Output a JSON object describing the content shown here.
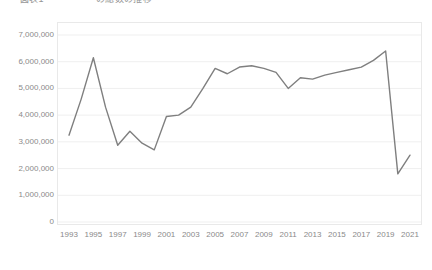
{
  "chart_title": "図表1 　　　　 　の総数の推移",
  "colors": {
    "line": "#7f7f7f",
    "gridline": "#efefef",
    "border": "#e9e9e9",
    "tick_text": "#8a8a8a"
  },
  "chart_data": {
    "type": "line",
    "title": "図表1 　　　　 　の総数の推移",
    "xlabel": "",
    "ylabel": "",
    "grid": true,
    "legend": "none",
    "xlim": [
      1993,
      2021
    ],
    "ylim": [
      0,
      7000000
    ],
    "ytick_labels": [
      "7,000,000",
      "6,000,000",
      "5,000,000",
      "4,000,000",
      "3,000,000",
      "2,000,000",
      "1,000,000",
      "0"
    ],
    "ytick_values": [
      7000000,
      6000000,
      5000000,
      4000000,
      3000000,
      2000000,
      1000000,
      0
    ],
    "xtick_labels": [
      "1993",
      "1995",
      "1997",
      "1999",
      "2001",
      "2003",
      "2005",
      "2007",
      "2009",
      "2011",
      "2013",
      "2015",
      "2017",
      "2019",
      "2021"
    ],
    "xtick_values": [
      1993,
      1995,
      1997,
      1999,
      2001,
      2003,
      2005,
      2007,
      2009,
      2011,
      2013,
      2015,
      2017,
      2019,
      2021
    ],
    "x": [
      1993,
      1994,
      1995,
      1996,
      1997,
      1998,
      1999,
      2000,
      2001,
      2002,
      2003,
      2004,
      2005,
      2006,
      2007,
      2008,
      2009,
      2010,
      2011,
      2012,
      2013,
      2014,
      2015,
      2016,
      2017,
      2018,
      2019,
      2020,
      2021
    ],
    "values": [
      3250000,
      4600000,
      6150000,
      4300000,
      2870000,
      3400000,
      2950000,
      2700000,
      3950000,
      4000000,
      4300000,
      5000000,
      5750000,
      5550000,
      5800000,
      5850000,
      5750000,
      5600000,
      5000000,
      5400000,
      5350000,
      5500000,
      5600000,
      5700000,
      5800000,
      6050000,
      6400000,
      1800000,
      2500000
    ],
    "series": [
      {
        "name": "総数",
        "values": [
          3250000,
          4600000,
          6150000,
          4300000,
          2870000,
          3400000,
          2950000,
          2700000,
          3950000,
          4000000,
          4300000,
          5000000,
          5750000,
          5550000,
          5800000,
          5850000,
          5750000,
          5600000,
          5000000,
          5400000,
          5350000,
          5500000,
          5600000,
          5700000,
          5800000,
          6050000,
          6400000,
          1800000,
          2500000
        ]
      }
    ]
  }
}
